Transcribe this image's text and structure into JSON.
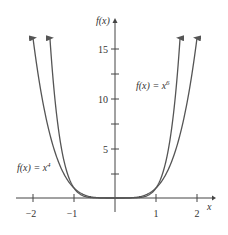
{
  "chart_data": {
    "type": "line",
    "title": "",
    "xlabel": "x",
    "ylabel": "f(x)",
    "xlim": [
      -2.3,
      2.3
    ],
    "ylim": [
      0,
      18
    ],
    "grid": false,
    "x_ticks": [
      -2,
      -1,
      1,
      2
    ],
    "x_tick_labels": [
      "−2",
      "−1",
      "1",
      "2"
    ],
    "y_ticks": [
      2.5,
      5,
      7.5,
      10,
      12.5,
      15
    ],
    "y_tick_labels": [
      "5",
      "10",
      "15"
    ],
    "series": [
      {
        "name": "f(x) = x^4",
        "label_base": "f(x) = x",
        "label_exp": "4",
        "formula": "x^4",
        "domain": [
          -2.05,
          2.05
        ]
      },
      {
        "name": "f(x) = x^6",
        "label_base": "f(x) = x",
        "label_exp": "6",
        "formula": "x^6",
        "domain": [
          -1.6,
          1.6
        ]
      }
    ],
    "annotations": [
      "f(x) = x^4",
      "f(x) = x^6"
    ],
    "colors": {
      "curve": "#555555",
      "axis": "#444444",
      "text": "#333333"
    }
  },
  "axes": {
    "x_label": "x",
    "y_label": "f(x)",
    "x_ticks": [
      {
        "label": "−2"
      },
      {
        "label": "−1"
      },
      {
        "label": "1"
      },
      {
        "label": "2"
      }
    ],
    "y_ticks": [
      {
        "label": "5"
      },
      {
        "label": "10"
      },
      {
        "label": "15"
      }
    ]
  },
  "labels": {
    "x4": {
      "base": "f(x) = x",
      "exp": "4"
    },
    "x6": {
      "base": "f(x) = x",
      "exp": "6"
    }
  }
}
